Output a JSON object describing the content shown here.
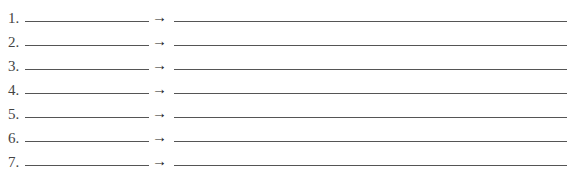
{
  "items": [
    {
      "number": "1.",
      "arrow": "→"
    },
    {
      "number": "2.",
      "arrow": "→"
    },
    {
      "number": "3.",
      "arrow": "→"
    },
    {
      "number": "4.",
      "arrow": "→"
    },
    {
      "number": "5.",
      "arrow": "→"
    },
    {
      "number": "6.",
      "arrow": "→"
    },
    {
      "number": "7.",
      "arrow": "→"
    }
  ]
}
